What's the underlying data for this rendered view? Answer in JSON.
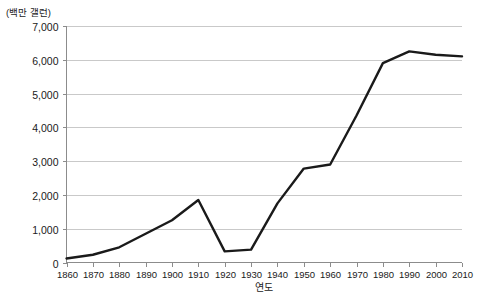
{
  "chart_data": {
    "type": "line",
    "title": "",
    "xlabel": "연도",
    "ylabel": "(백만 갤런)",
    "x": [
      1860,
      1870,
      1880,
      1890,
      1900,
      1910,
      1920,
      1930,
      1940,
      1950,
      1960,
      1970,
      1980,
      1990,
      2000,
      2010
    ],
    "values": [
      120,
      230,
      450,
      850,
      1250,
      1850,
      330,
      380,
      1750,
      2780,
      2900,
      4350,
      5900,
      6250,
      6150,
      6100
    ],
    "series": [
      {
        "name": "소비량",
        "values": [
          120,
          230,
          450,
          850,
          1250,
          1850,
          330,
          380,
          1750,
          2780,
          2900,
          4350,
          5900,
          6250,
          6150,
          6100
        ]
      }
    ],
    "xlim": [
      1860,
      2010
    ],
    "ylim": [
      0,
      7000
    ],
    "ytick_labels": [
      "0",
      "1,000",
      "2,000",
      "3,000",
      "4,000",
      "5,000",
      "6,000",
      "7,000"
    ],
    "ytick_values": [
      0,
      1000,
      2000,
      3000,
      4000,
      5000,
      6000,
      7000
    ],
    "xtick_labels": [
      "1860",
      "1870",
      "1880",
      "1890",
      "1900",
      "1910",
      "1920",
      "1930",
      "1940",
      "1950",
      "1960",
      "1970",
      "1980",
      "1990",
      "2000",
      "2010"
    ],
    "grid": "horizontal",
    "legend": "none",
    "line_color": "#1a1a1a",
    "grid_color": "#c9c9c9",
    "axis_color": "#8c8c8c"
  }
}
